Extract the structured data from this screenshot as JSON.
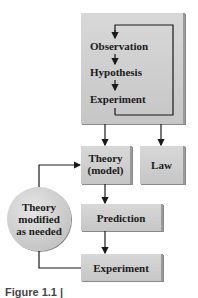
{
  "diagram": {
    "top_box": {
      "steps": [
        "Observation",
        "Hypothesis",
        "Experiment"
      ]
    },
    "theory_box": {
      "line1": "Theory",
      "line2": "(model)"
    },
    "law_box": {
      "label": "Law"
    },
    "prediction_box": {
      "label": "Prediction"
    },
    "experiment_box": {
      "label": "Experiment"
    },
    "modified_circle": {
      "line1": "Theory",
      "line2": "modified",
      "line3": "as needed"
    },
    "colors": {
      "box_fill": "#cfcfcf",
      "arrow": "#1a1a1a",
      "text": "#1a1a1a"
    }
  },
  "caption": {
    "text": "Figure 1.1 |"
  }
}
